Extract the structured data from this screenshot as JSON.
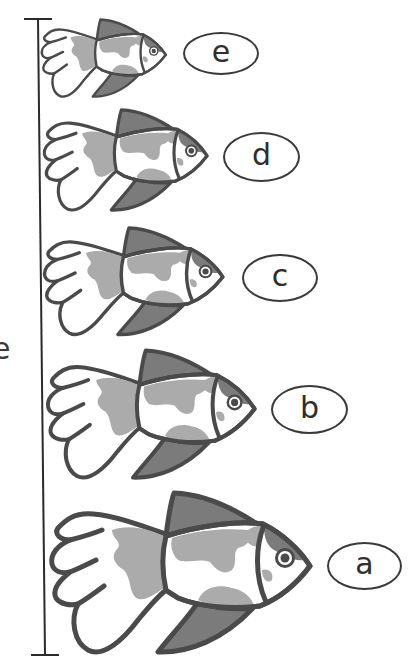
{
  "figure": {
    "scale_bar": {
      "partial_label": "e"
    },
    "colors": {
      "outline": "#4a4a4a",
      "fin": "#7b7b7b",
      "patch": "#ababab",
      "body": "#ffffff"
    },
    "fish": [
      {
        "id": "e",
        "label": "e",
        "order_from_top": 1,
        "size_rank": 5
      },
      {
        "id": "d",
        "label": "d",
        "order_from_top": 2,
        "size_rank": 4
      },
      {
        "id": "c",
        "label": "c",
        "order_from_top": 3,
        "size_rank": 3
      },
      {
        "id": "b",
        "label": "b",
        "order_from_top": 4,
        "size_rank": 2
      },
      {
        "id": "a",
        "label": "a",
        "order_from_top": 5,
        "size_rank": 1
      }
    ]
  }
}
